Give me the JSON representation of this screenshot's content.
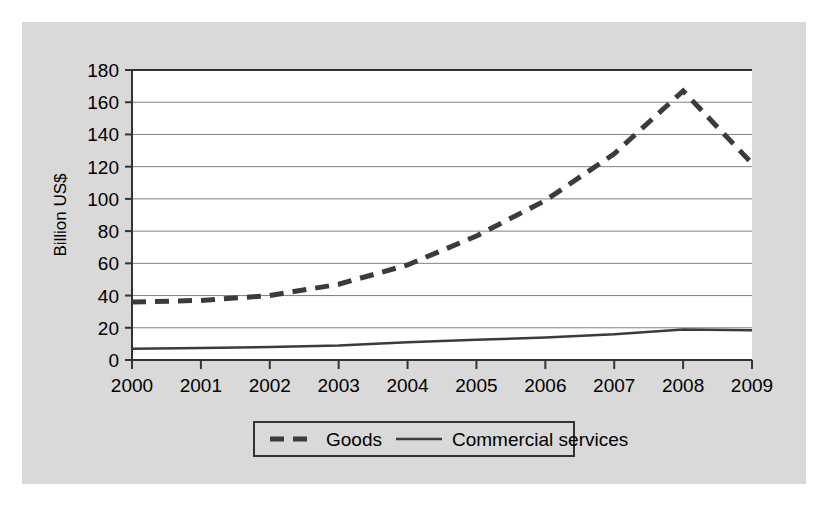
{
  "figure": {
    "background_color": "#ffffff",
    "panel_color": "#d9d9d9",
    "plot_background_color": "#ffffff",
    "axis_color": "#333333",
    "grid_color": "#808080"
  },
  "chart_data": {
    "type": "line",
    "title": "",
    "xlabel": "",
    "ylabel": "Billion US$",
    "categories": [
      "2000",
      "2001",
      "2002",
      "2003",
      "2004",
      "2005",
      "2006",
      "2007",
      "2008",
      "2009"
    ],
    "x": [
      2000,
      2001,
      2002,
      2003,
      2004,
      2005,
      2006,
      2007,
      2008,
      2009
    ],
    "xlim": [
      2000,
      2009
    ],
    "ylim": [
      0,
      180
    ],
    "yticks": [
      0,
      20,
      40,
      60,
      80,
      100,
      120,
      140,
      160,
      180
    ],
    "ytick_labels": [
      "0",
      "20",
      "40",
      "60",
      "80",
      "100",
      "120",
      "140",
      "160",
      "180"
    ],
    "xtick_labels": [
      "2000",
      "2001",
      "2002",
      "2003",
      "2004",
      "2005",
      "2006",
      "2007",
      "2008",
      "2009"
    ],
    "grid": "horizontal",
    "legend_position": "bottom-center",
    "series": [
      {
        "name": "Goods",
        "style": "dashed",
        "color": "#3b3b3b",
        "width": 5,
        "values": [
          36,
          37,
          40,
          47,
          59,
          77,
          99,
          128,
          167,
          122
        ]
      },
      {
        "name": "Commercial services",
        "style": "solid",
        "color": "#3b3b3b",
        "width": 2.5,
        "values": [
          7,
          7.5,
          8,
          9,
          11,
          12.5,
          14,
          16,
          19,
          18.5
        ]
      }
    ]
  },
  "legend": {
    "items": [
      {
        "label": "Goods",
        "style": "dashed"
      },
      {
        "label": "Commercial services",
        "style": "solid"
      }
    ]
  }
}
